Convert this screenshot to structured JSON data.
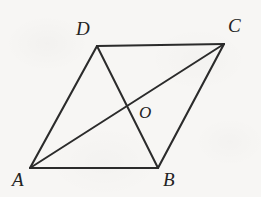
{
  "figure": {
    "type": "geometry-diagram",
    "shape": "parallelogram",
    "background_color": "#f7f6f4",
    "stroke_color": "#2b2b2b",
    "label_color": "#232323",
    "canvas": {
      "width": 261,
      "height": 197
    },
    "vertices": [
      {
        "name": "A",
        "x": 30,
        "y": 168,
        "label": "A",
        "label_x": 12,
        "label_y": 170
      },
      {
        "name": "B",
        "x": 158,
        "y": 168,
        "label": "B",
        "label_x": 163,
        "label_y": 170
      },
      {
        "name": "C",
        "x": 224,
        "y": 44,
        "label": "C",
        "label_x": 228,
        "label_y": 16
      },
      {
        "name": "D",
        "x": 97,
        "y": 46,
        "label": "D",
        "label_x": 76,
        "label_y": 19
      }
    ],
    "intersection": {
      "name": "O",
      "x": 126,
      "y": 103,
      "label": "O",
      "label_x": 139,
      "label_y": 104
    },
    "edges": [
      {
        "name": "side-AD",
        "from": "A",
        "to": "D"
      },
      {
        "name": "side-DC",
        "from": "D",
        "to": "C"
      },
      {
        "name": "side-CB",
        "from": "C",
        "to": "B"
      },
      {
        "name": "side-BA",
        "from": "B",
        "to": "A"
      }
    ],
    "diagonals": [
      {
        "name": "diagonal-AC",
        "from": "A",
        "to": "C"
      },
      {
        "name": "diagonal-DB",
        "from": "D",
        "to": "B"
      }
    ]
  }
}
